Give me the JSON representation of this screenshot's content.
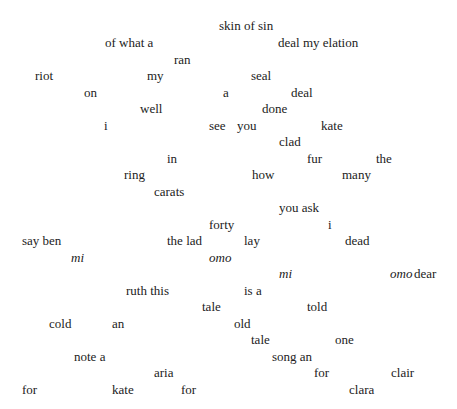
{
  "poem": {
    "words": [
      {
        "text": "skin of sin",
        "x": 219,
        "y": 18
      },
      {
        "text": "of what a",
        "x": 105,
        "y": 35
      },
      {
        "text": "deal my elation",
        "x": 278,
        "y": 35
      },
      {
        "text": "ran",
        "x": 174,
        "y": 52
      },
      {
        "text": "riot",
        "x": 35,
        "y": 68
      },
      {
        "text": "my",
        "x": 147,
        "y": 68
      },
      {
        "text": "seal",
        "x": 251,
        "y": 68
      },
      {
        "text": "on",
        "x": 84,
        "y": 85
      },
      {
        "text": "a",
        "x": 223,
        "y": 85
      },
      {
        "text": "deal",
        "x": 291,
        "y": 85
      },
      {
        "text": "well",
        "x": 140,
        "y": 101
      },
      {
        "text": "done",
        "x": 262,
        "y": 101
      },
      {
        "text": "i",
        "x": 104,
        "y": 118
      },
      {
        "text": "see",
        "x": 209,
        "y": 118
      },
      {
        "text": "you",
        "x": 237,
        "y": 118
      },
      {
        "text": "kate",
        "x": 321,
        "y": 118
      },
      {
        "text": "clad",
        "x": 279,
        "y": 134
      },
      {
        "text": "in",
        "x": 167,
        "y": 151
      },
      {
        "text": "fur",
        "x": 307,
        "y": 151
      },
      {
        "text": "the",
        "x": 376,
        "y": 151
      },
      {
        "text": "ring",
        "x": 124,
        "y": 167
      },
      {
        "text": "how",
        "x": 252,
        "y": 167
      },
      {
        "text": "many",
        "x": 342,
        "y": 167
      },
      {
        "text": "carats",
        "x": 154,
        "y": 184
      },
      {
        "text": "you ask",
        "x": 279,
        "y": 200
      },
      {
        "text": "forty",
        "x": 209,
        "y": 217
      },
      {
        "text": "i",
        "x": 328,
        "y": 217
      },
      {
        "text": "say ben",
        "x": 22,
        "y": 233
      },
      {
        "text": "the lad",
        "x": 167,
        "y": 233
      },
      {
        "text": "lay",
        "x": 244,
        "y": 233
      },
      {
        "text": "dead",
        "x": 345,
        "y": 233
      },
      {
        "text": "mi",
        "x": 71,
        "y": 250,
        "italic": true
      },
      {
        "text": "omo",
        "x": 209,
        "y": 250,
        "italic": true
      },
      {
        "text": "mi",
        "x": 279,
        "y": 266,
        "italic": true
      },
      {
        "text": "omo",
        "x": 390,
        "y": 266,
        "italic": true
      },
      {
        "text": "dear",
        "x": 414,
        "y": 266
      },
      {
        "text": "ruth this",
        "x": 126,
        "y": 283
      },
      {
        "text": "is a",
        "x": 244,
        "y": 283
      },
      {
        "text": "tale",
        "x": 202,
        "y": 299
      },
      {
        "text": "told",
        "x": 307,
        "y": 299
      },
      {
        "text": "cold",
        "x": 49,
        "y": 316
      },
      {
        "text": "an",
        "x": 112,
        "y": 316
      },
      {
        "text": "old",
        "x": 234,
        "y": 316
      },
      {
        "text": "tale",
        "x": 251,
        "y": 332
      },
      {
        "text": "one",
        "x": 335,
        "y": 332
      },
      {
        "text": "note a",
        "x": 74,
        "y": 349
      },
      {
        "text": "song an",
        "x": 272,
        "y": 349
      },
      {
        "text": "aria",
        "x": 154,
        "y": 365
      },
      {
        "text": "for",
        "x": 314,
        "y": 365
      },
      {
        "text": "clair",
        "x": 391,
        "y": 365
      },
      {
        "text": "for",
        "x": 22,
        "y": 382
      },
      {
        "text": "kate",
        "x": 112,
        "y": 382
      },
      {
        "text": "for",
        "x": 181,
        "y": 382
      },
      {
        "text": "clara",
        "x": 349,
        "y": 382
      }
    ]
  }
}
